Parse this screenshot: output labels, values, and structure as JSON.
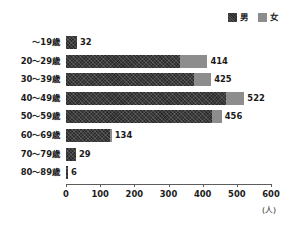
{
  "legend": {
    "position": "top-right",
    "entries": [
      {
        "label": "男",
        "color": "#2b2b2b",
        "icon": "square-swatch-icon"
      },
      {
        "label": "女",
        "color": "#8d8d8d",
        "icon": "square-swatch-icon"
      }
    ]
  },
  "axis": {
    "unit": "(人)",
    "ticks": [
      "0",
      "100",
      "200",
      "300",
      "400",
      "500",
      "600"
    ]
  },
  "chart_data": {
    "type": "bar",
    "orientation": "horizontal",
    "stacked": true,
    "title": "",
    "subtitle": "",
    "xlabel": "(人)",
    "ylabel": "",
    "grid": false,
    "legend_position": "top-right",
    "xlim": [
      0,
      600
    ],
    "xticks": [
      0,
      100,
      200,
      300,
      400,
      500,
      600
    ],
    "categories": [
      "～19歳",
      "20～29歳",
      "30～39歳",
      "40～49歳",
      "50～59歳",
      "60～69歳",
      "70～79歳",
      "80～89歳"
    ],
    "series": [
      {
        "name": "男",
        "color": "#2b2b2b",
        "values": [
          32,
          335,
          375,
          468,
          427,
          128,
          29,
          6
        ]
      },
      {
        "name": "女",
        "color": "#8d8d8d",
        "values": [
          0,
          79,
          50,
          54,
          29,
          6,
          0,
          0
        ]
      }
    ],
    "totals": [
      32,
      414,
      425,
      522,
      456,
      134,
      29,
      6
    ],
    "data_labels": [
      "32",
      "414",
      "425",
      "522",
      "456",
      "134",
      "29",
      "6"
    ]
  }
}
